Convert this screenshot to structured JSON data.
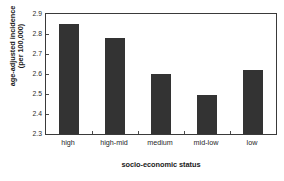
{
  "chart_data": {
    "type": "bar",
    "title": "",
    "categories": [
      "high",
      "high-mid",
      "medium",
      "mid-low",
      "low"
    ],
    "values": [
      2.85,
      2.78,
      2.6,
      2.495,
      2.62
    ],
    "xlabel": "socio-economic status",
    "ylabel_line1": "age-adjusted incidence",
    "ylabel_line2": "(per 100,000)",
    "ylabel": "age-adjusted incidence (per 100,000)",
    "ylim": [
      2.3,
      2.9
    ],
    "ytick_labels": [
      "2.3",
      "2.4",
      "2.5",
      "2.6",
      "2.7",
      "2.8",
      "2.9"
    ],
    "ytick_values": [
      2.3,
      2.4,
      2.5,
      2.6,
      2.7,
      2.8,
      2.9
    ],
    "grid": false,
    "legend": "none",
    "bar_color": "#333333",
    "axis_color": "#3a3a3a",
    "background_color": "#ffffff"
  }
}
